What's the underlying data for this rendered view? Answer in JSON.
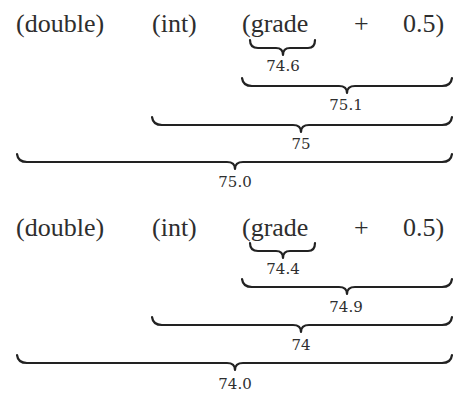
{
  "expressions": [
    {
      "tokens": [
        "(double)",
        "(int)",
        "(grade",
        "+",
        "0.5)"
      ],
      "evaluations": [
        {
          "span": "grade",
          "value": "74.6"
        },
        {
          "span": "grade + 0.5",
          "value": "75.1"
        },
        {
          "span": "(int)(grade + 0.5)",
          "value": "75"
        },
        {
          "span": "(double)(int)(grade + 0.5)",
          "value": "75.0"
        }
      ]
    },
    {
      "tokens": [
        "(double)",
        "(int)",
        "(grade",
        "+",
        "0.5)"
      ],
      "evaluations": [
        {
          "span": "grade",
          "value": "74.4"
        },
        {
          "span": "grade + 0.5",
          "value": "74.9"
        },
        {
          "span": "(int)(grade + 0.5)",
          "value": "74"
        },
        {
          "span": "(double)(int)(grade + 0.5)",
          "value": "74.0"
        }
      ]
    }
  ]
}
